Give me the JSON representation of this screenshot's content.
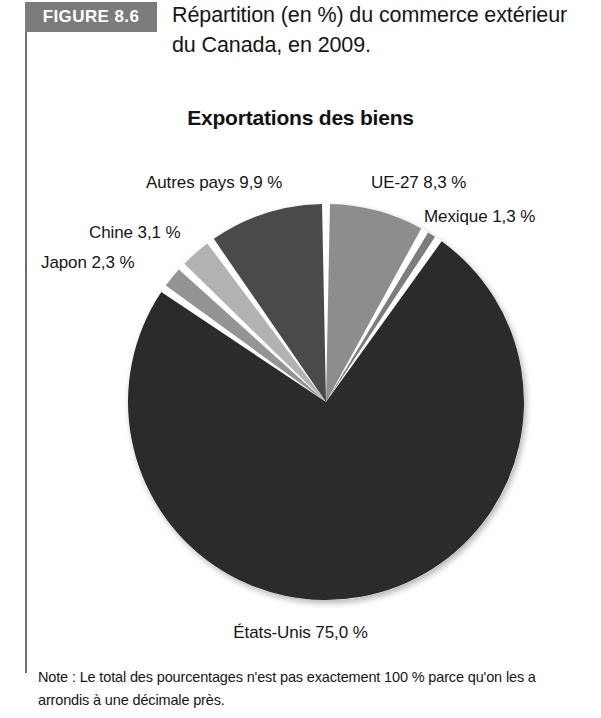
{
  "figure": {
    "badge_label": "FIGURE 8.6",
    "caption": "Répartition (en %) du commerce extérieur du Canada, en 2009."
  },
  "note": {
    "text": "Note : Le total des pourcentages n'est pas exactement 100 % parce qu'on les a arrondis à une décimale près."
  },
  "labels": {
    "autres": "Autres pays 9,9 %",
    "ue27": "UE-27 8,3 %",
    "mexique": "Mexique 1,3 %",
    "chine": "Chine 3,1 %",
    "japon": "Japon 2,3 %",
    "etatsunis": "États-Unis 75,0 %"
  },
  "colors": {
    "badge_background": "#7b7b7b",
    "rule": "#6d6d6d",
    "etats_unis": "#2b2b2b",
    "autres_pays": "#4a4a4a",
    "ue_27": "#8d8d8d",
    "mexique": "#7d7d7d",
    "chine": "#b2b2b2",
    "japon": "#949494",
    "separator": "#ffffff",
    "text": "#161616"
  },
  "chart_data": {
    "type": "pie",
    "title": "Exportations des biens",
    "unit": "%",
    "start_angle_deg": 0,
    "direction": "clockwise",
    "center": {
      "x": 326,
      "y": 402
    },
    "radius": 198,
    "categories": [
      "UE-27",
      "Mexique",
      "États-Unis",
      "Japon",
      "Chine",
      "Autres pays"
    ],
    "values": [
      8.3,
      1.3,
      75.0,
      2.3,
      3.1,
      9.9
    ],
    "slices": [
      {
        "name": "UE-27",
        "value": 8.3,
        "label": "UE-27 8,3 %",
        "color": "#8d8d8d"
      },
      {
        "name": "Mexique",
        "value": 1.3,
        "label": "Mexique 1,3 %",
        "color": "#7d7d7d"
      },
      {
        "name": "États-Unis",
        "value": 75.0,
        "label": "États-Unis 75,0 %",
        "color": "#2b2b2b"
      },
      {
        "name": "Japon",
        "value": 2.3,
        "label": "Japon 2,3 %",
        "color": "#949494"
      },
      {
        "name": "Chine",
        "value": 3.1,
        "label": "Chine 3,1 %",
        "color": "#b2b2b2"
      },
      {
        "name": "Autres pays",
        "value": 9.9,
        "label": "Autres pays 9,9 %",
        "color": "#4a4a4a"
      }
    ],
    "total": 99.9,
    "legend": "none",
    "grid": false
  }
}
